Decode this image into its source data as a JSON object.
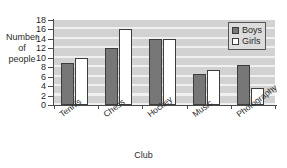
{
  "chart_data": {
    "type": "bar",
    "title": "",
    "xlabel": "Club",
    "ylabel": "Number of people",
    "ylabel_lines": [
      "Number",
      "of",
      "people"
    ],
    "categories": [
      "Tennis",
      "Chess",
      "Hockey",
      "Music",
      "Photography"
    ],
    "series": [
      {
        "name": "Boys",
        "values": [
          9,
          12,
          14,
          6.5,
          8.5
        ],
        "color": "#777777"
      },
      {
        "name": "Girls",
        "values": [
          10,
          16,
          14,
          7.5,
          3.5
        ],
        "color": "#ffffff"
      }
    ],
    "ylim": [
      0,
      18
    ],
    "ytick_step": 2,
    "ytick_labels": [
      "18",
      "16",
      "14",
      "12",
      "10",
      "8",
      "6",
      "4",
      "2",
      "0"
    ],
    "grid": true,
    "grid_axis": "y",
    "legend_position": "top-right",
    "legend_entries": [
      "Boys",
      "Girls"
    ],
    "plot_background": "#d2d2d2",
    "axis_color": "#4a4a4a",
    "bar_outline_color": "#3d3d3d"
  },
  "axes": {
    "x_title": "Club"
  },
  "legend": {
    "entries": [
      {
        "label": "Boys"
      },
      {
        "label": "Girls"
      }
    ]
  }
}
